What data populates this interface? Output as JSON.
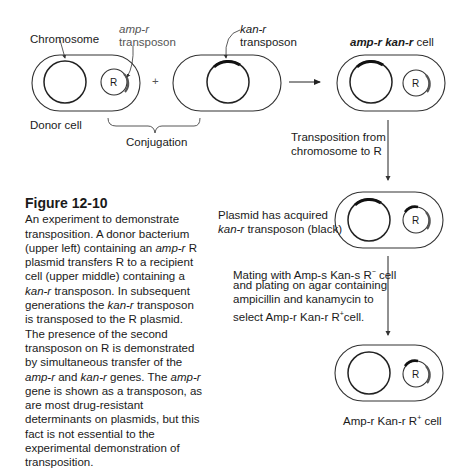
{
  "labels": {
    "chromosome": "Chromosome",
    "amp_r_italic": "amp-r",
    "transposon": "transposon",
    "kan_r_italic": "kan-r",
    "kan_transposon": "transposon",
    "donor_cell": "Donor  cell",
    "conjugation": "Conjugation",
    "plus": "+",
    "result_cell_amp": "amp-r",
    "result_cell_kan": "kan-r",
    "result_cell_word": "cell",
    "plasmid_R": "R",
    "transposition_line1": "Transposition from",
    "transposition_line2": "chromosome to R",
    "acquired_line1": "Plasmid has acquired",
    "acquired_italic": "kan-r",
    "acquired_line2_rest": " transposon (black)",
    "mating_line1": "Mating with Amp-s Kan-s R",
    "mating_sup": "−",
    "mating_line1_end": " cell",
    "mating_line2": "and plating on agar containing",
    "mating_line3": "ampicillin and kanamycin to",
    "mating_line4": "select Amp-r Kan-r R",
    "mating_sup2": "+",
    "mating_line4_end": "cell.",
    "final_cell": "Amp-r Kan-r R",
    "final_sup": "+",
    "final_end": " cell"
  },
  "caption": {
    "title": "Figure 12-10",
    "segments": [
      {
        "t": "An experiment to demonstrate transposition. A donor bacterium (upper left) containing an ",
        "s": ""
      },
      {
        "t": "amp-r",
        "s": "it"
      },
      {
        "t": " R plasmid transfers R to a recipient cell (upper middle) containing a ",
        "s": ""
      },
      {
        "t": "kan-r",
        "s": "it"
      },
      {
        "t": " transposon. In subsequent generations the ",
        "s": ""
      },
      {
        "t": "kan-r",
        "s": "it"
      },
      {
        "t": " transposon is transposed to the R plasmid. The presence of the second transposon on R is demonstrated by simultaneous transfer of the ",
        "s": ""
      },
      {
        "t": "amp-r",
        "s": "it"
      },
      {
        "t": " and ",
        "s": ""
      },
      {
        "t": "kan-r",
        "s": "it"
      },
      {
        "t": " genes. The ",
        "s": ""
      },
      {
        "t": "amp-r",
        "s": "it"
      },
      {
        "t": " gene is shown as a transposon, as are most drug-resistant determinants on plasmids, but this fact is not essential to the experimental demonstration of transposition.",
        "s": ""
      }
    ]
  }
}
